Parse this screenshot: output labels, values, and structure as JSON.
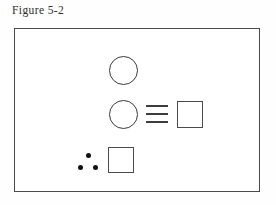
{
  "figure": {
    "caption": "Figure 5-2",
    "frame": {
      "border_color": "#4a4a4a",
      "background": "#ffffff"
    },
    "rows": [
      {
        "name": "top-row",
        "elements": [
          {
            "kind": "circle",
            "label": "circle",
            "outline_color": "#3a3a3a"
          }
        ]
      },
      {
        "name": "middle-row",
        "elements": [
          {
            "kind": "circle",
            "label": "circle",
            "outline_color": "#3a3a3a"
          },
          {
            "kind": "triple-bar",
            "label": "identical-to-symbol",
            "bars": 3,
            "color": "#3d3d3d"
          },
          {
            "kind": "square",
            "label": "square",
            "outline_color": "#4a4a4a"
          }
        ]
      },
      {
        "name": "bottom-row",
        "elements": [
          {
            "kind": "dot-cluster",
            "label": "three-dots",
            "count": 3,
            "color": "#111111"
          },
          {
            "kind": "square",
            "label": "square",
            "outline_color": "#4a4a4a"
          }
        ]
      }
    ]
  }
}
